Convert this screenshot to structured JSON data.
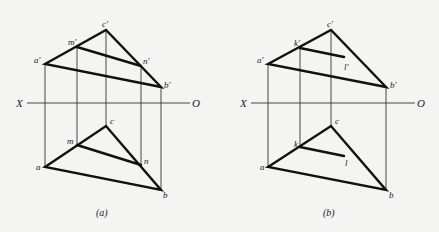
{
  "figure": {
    "axis": {
      "left_label": "X",
      "right_label": "O"
    },
    "panels": [
      {
        "id": "a",
        "caption": "(a)",
        "front_view": {
          "points": {
            "a'": [
              45,
              64
            ],
            "m'": [
              77,
              47
            ],
            "c'": [
              106,
              30
            ],
            "n'": [
              141,
              66
            ],
            "b'": [
              161,
              87
            ]
          },
          "labels": {
            "a": "a'",
            "m": "m'",
            "c": "c'",
            "n": "n'",
            "b": "b'"
          },
          "lines": [
            [
              "a'",
              "c'"
            ],
            [
              "c'",
              "b'"
            ],
            [
              "a'",
              "b'"
            ],
            [
              "m'",
              "n'"
            ]
          ]
        },
        "top_view": {
          "points": {
            "a": [
              45,
              167
            ],
            "m": [
              77,
              145
            ],
            "c": [
              106,
              126
            ],
            "n": [
              141,
              165
            ],
            "b": [
              161,
              190
            ]
          },
          "labels": {
            "a": "a",
            "m": "m",
            "c": "c",
            "n": "n",
            "b": "b"
          },
          "lines": [
            [
              "a",
              "c"
            ],
            [
              "c",
              "b"
            ],
            [
              "a",
              "b"
            ],
            [
              "m",
              "n"
            ]
          ]
        },
        "projectors_x": [
          45,
          77,
          106,
          141,
          161
        ]
      },
      {
        "id": "b",
        "caption": "(b)",
        "front_view": {
          "points": {
            "a'": [
              268,
              64
            ],
            "k'": [
              300,
              48
            ],
            "c'": [
              331,
              30
            ],
            "l'": [
              344,
              57
            ],
            "b'": [
              386,
              87
            ]
          },
          "labels": {
            "a": "a'",
            "k": "k'",
            "c": "c'",
            "l": "l'",
            "b": "b'"
          },
          "lines": [
            [
              "a'",
              "c'"
            ],
            [
              "c'",
              "b'"
            ],
            [
              "a'",
              "b'"
            ],
            [
              "k'",
              "l'"
            ]
          ]
        },
        "top_view": {
          "points": {
            "a": [
              268,
              167
            ],
            "k": [
              300,
              147
            ],
            "c": [
              331,
              126
            ],
            "l": [
              344,
              156
            ],
            "b": [
              386,
              190
            ]
          },
          "labels": {
            "a": "a",
            "k": "k",
            "c": "c",
            "l": "l",
            "b": "b"
          },
          "lines": [
            [
              "a",
              "c"
            ],
            [
              "c",
              "b"
            ],
            [
              "a",
              "b"
            ],
            [
              "k",
              "l"
            ]
          ]
        },
        "projectors_x": [
          268,
          300,
          331,
          386
        ]
      }
    ]
  }
}
